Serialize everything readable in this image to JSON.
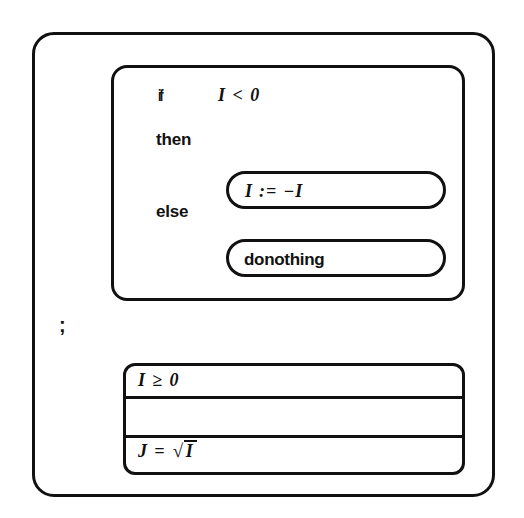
{
  "diagram": {
    "stroke_color": "#111111",
    "background_color": "#ffffff",
    "outer_frame": {
      "label": "program-body"
    },
    "if_block": {
      "if_keyword": "if",
      "condition": "I < 0",
      "then_keyword": "then",
      "else_keyword": "else",
      "then_statement": "I := −I",
      "else_statement": "donothing"
    },
    "separator": ";",
    "lower_block": {
      "rows": [
        {
          "text": "I ≥  0",
          "kind": "assertion"
        },
        {
          "text": "",
          "kind": "blank"
        },
        {
          "text_prefix": "J = ",
          "radical_symbol": "√",
          "radicand": "I",
          "kind": "assignment"
        }
      ]
    }
  }
}
